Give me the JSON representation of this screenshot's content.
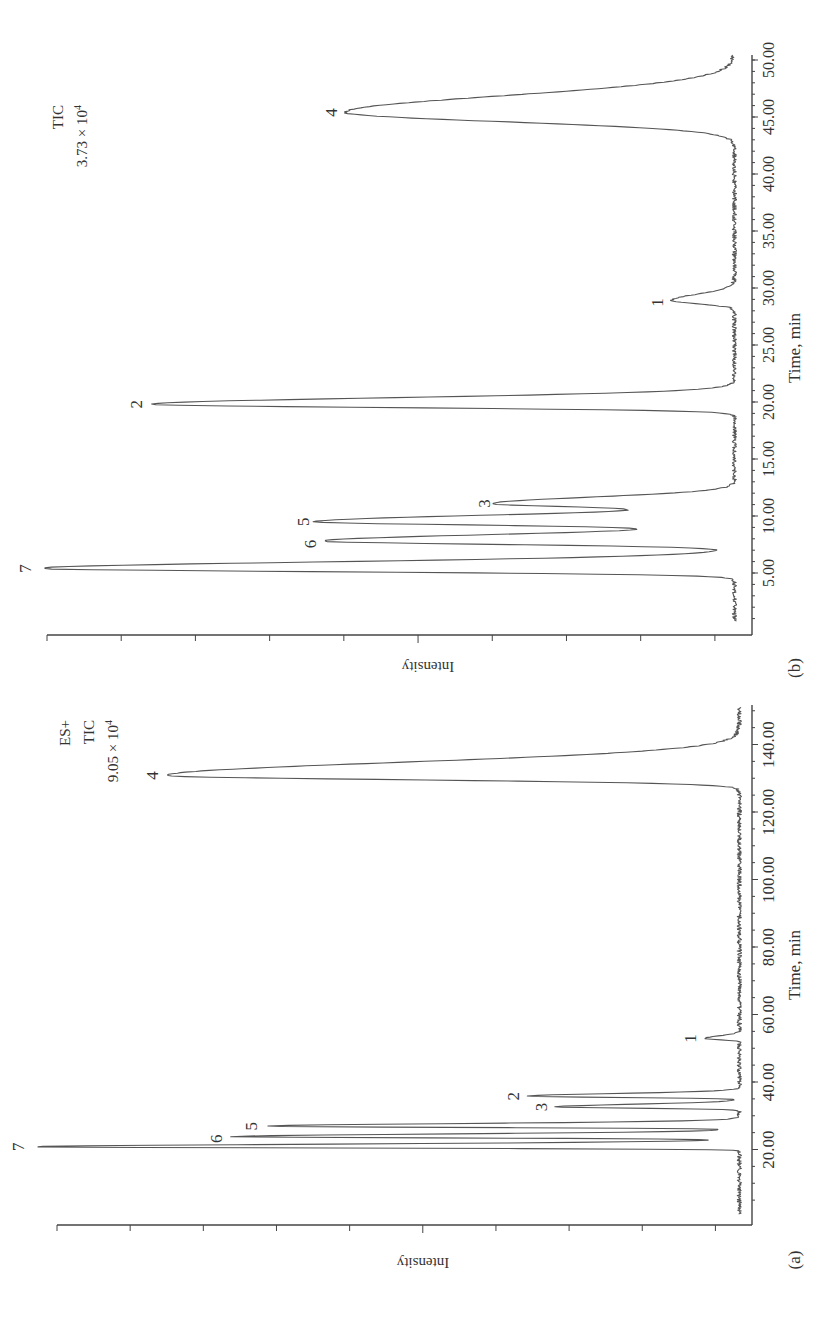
{
  "figure": {
    "panels": [
      "(a)",
      "(b)"
    ],
    "caption_fragment_visible": false
  },
  "chart_data": [
    {
      "type": "line",
      "panel_label": "(a)",
      "title": "",
      "annotation_lines": [
        "ES+",
        "TIC",
        "9.05 × 10^4"
      ],
      "annotation": {
        "mode": "ES+",
        "trace": "TIC",
        "max_intensity": "9.05 × 10",
        "exponent": "4"
      },
      "xlabel": "Time, min",
      "ylabel": "Intensity",
      "xlim": [
        0,
        152
      ],
      "x_ticks": [
        "20.00",
        "40.00",
        "60.00",
        "80.00",
        "100.00",
        "120.00",
        "140.00"
      ],
      "x_tick_values": [
        20,
        40,
        60,
        80,
        100,
        120,
        140
      ],
      "y_ticks_count": 10,
      "grid": false,
      "peaks": [
        {
          "label": "7",
          "time": 20.8,
          "rel_intensity": 1.0
        },
        {
          "label": "6",
          "time": 23.8,
          "rel_intensity": 0.72
        },
        {
          "label": "5",
          "time": 26.9,
          "rel_intensity": 0.67
        },
        {
          "label": "3",
          "time": 32.6,
          "rel_intensity": 0.26
        },
        {
          "label": "2",
          "time": 35.8,
          "rel_intensity": 0.3
        },
        {
          "label": "1",
          "time": 52.9,
          "rel_intensity": 0.05
        },
        {
          "label": "4",
          "time": 130.8,
          "rel_intensity": 0.81
        }
      ]
    },
    {
      "type": "line",
      "panel_label": "(b)",
      "title": "",
      "annotation_lines": [
        "TIC",
        "3.73 × 10^4"
      ],
      "annotation": {
        "trace": "TIC",
        "max_intensity": "3.73 × 10",
        "exponent": "4"
      },
      "xlabel": "Time, min",
      "ylabel": "Intensity",
      "xlim": [
        0,
        51
      ],
      "x_ticks": [
        "5.00",
        "10.00",
        "15.00",
        "20.00",
        "25.00",
        "30.00",
        "35.00",
        "40.00",
        "45.00",
        "50.00"
      ],
      "x_tick_values": [
        5,
        10,
        15,
        20,
        25,
        30,
        35,
        40,
        45,
        50
      ],
      "y_ticks_count": 10,
      "grid": false,
      "peaks": [
        {
          "label": "7",
          "time": 5.4,
          "rel_intensity": 1.0
        },
        {
          "label": "6",
          "time": 7.8,
          "rel_intensity": 0.59
        },
        {
          "label": "5",
          "time": 9.5,
          "rel_intensity": 0.6
        },
        {
          "label": "3",
          "time": 11.1,
          "rel_intensity": 0.34
        },
        {
          "label": "2",
          "time": 19.8,
          "rel_intensity": 0.84
        },
        {
          "label": "1",
          "time": 28.9,
          "rel_intensity": 0.09
        },
        {
          "label": "4",
          "time": 45.4,
          "rel_intensity": 0.56
        }
      ]
    }
  ]
}
